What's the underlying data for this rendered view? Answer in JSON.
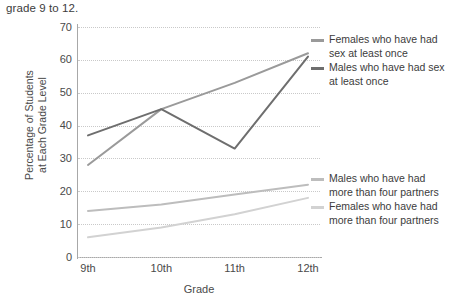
{
  "caption": "grade 9 to 12.",
  "chart_data": {
    "type": "line",
    "title": "",
    "xlabel": "Grade",
    "ylabel": "Percentage of Students at Each Grade Level",
    "categories": [
      "9th",
      "10th",
      "11th",
      "12th"
    ],
    "yticks": [
      0,
      10,
      20,
      30,
      40,
      50,
      60,
      70
    ],
    "ylim": [
      0,
      70
    ],
    "grid": "horizontal-dotted",
    "legend_position": "right",
    "series": [
      {
        "name": "Females who have had sex at least once",
        "values": [
          28,
          45,
          53,
          62
        ],
        "color": "#9a9a9a"
      },
      {
        "name": "Males who have had sex at least once",
        "values": [
          37,
          45,
          33,
          61
        ],
        "color": "#6e6e6e"
      },
      {
        "name": "Males who have had more than four partners",
        "values": [
          14,
          16,
          19,
          22
        ],
        "color": "#bdbdbd"
      },
      {
        "name": "Females who have had more than four partners",
        "values": [
          6,
          9,
          13,
          18
        ],
        "color": "#d2d2d2"
      }
    ]
  },
  "ylabel_lines": {
    "line1": "Percentage of Students",
    "line2": "at Each Grade Level"
  }
}
